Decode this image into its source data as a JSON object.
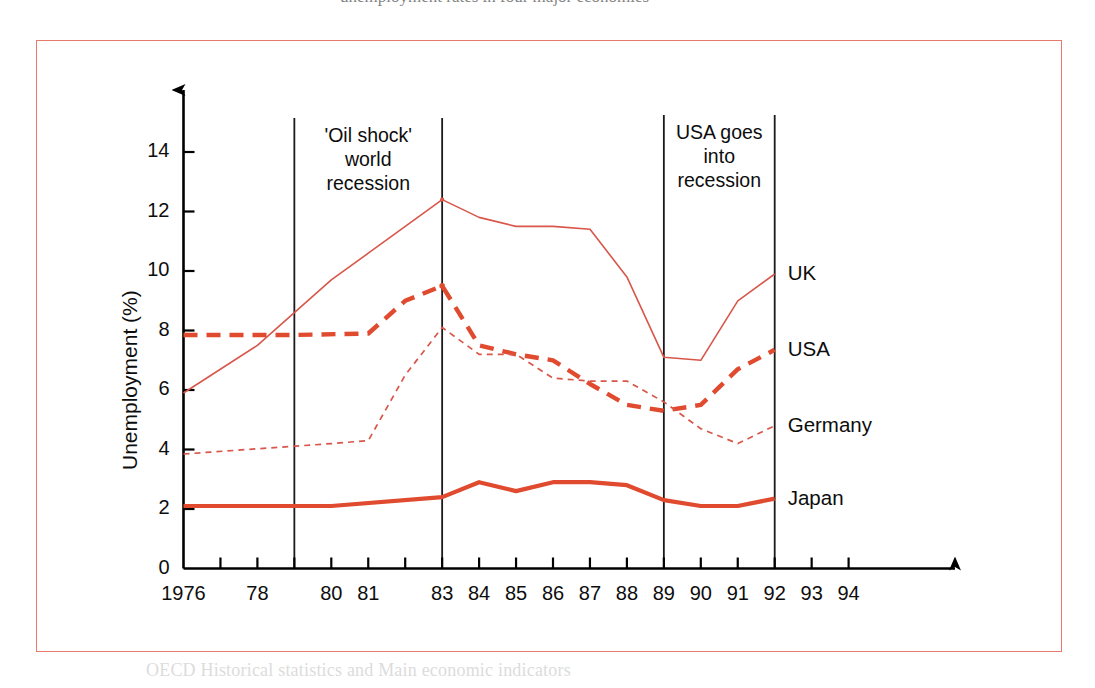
{
  "figure": {
    "frame_color": "#e8796a",
    "background": "#ffffff",
    "top_partial_text": "unemployment rates in four major economies",
    "bottom_partial_text": "OECD Historical statistics and Main economic indicators"
  },
  "chart_data": {
    "type": "line",
    "title": "",
    "subtitle": "",
    "xlabel": "",
    "ylabel": "Unemployment (%)",
    "xlim": [
      1976,
      1994.6
    ],
    "ylim": [
      0,
      15.2
    ],
    "yticks": [
      0,
      2,
      4,
      6,
      8,
      10,
      12,
      14
    ],
    "ytick_labels": [
      "0",
      "2",
      "4",
      "6",
      "8",
      "10",
      "12",
      "14"
    ],
    "xticks": [
      1976,
      1977,
      1978,
      1979,
      1980,
      1981,
      1982,
      1983,
      1984,
      1985,
      1986,
      1987,
      1988,
      1989,
      1990,
      1991,
      1992,
      1993,
      1994
    ],
    "xtick_labels": [
      "1976",
      "",
      "78",
      "",
      "80",
      "81",
      "",
      "83",
      "84",
      "85",
      "86",
      "87",
      "88",
      "89",
      "90",
      "91",
      "92",
      "93",
      "94"
    ],
    "grid": false,
    "legend_position": "right-of-line-ends",
    "series": [
      {
        "name": "UK",
        "label": "UK",
        "color": "#d8564a",
        "style": "solid-thin",
        "x": [
          1976,
          1978,
          1980,
          1981,
          1983,
          1984,
          1985,
          1986,
          1987,
          1988,
          1989,
          1990,
          1991,
          1992
        ],
        "values": [
          5.9,
          7.5,
          9.7,
          10.6,
          12.4,
          11.8,
          11.5,
          11.5,
          11.4,
          9.8,
          7.1,
          7.0,
          9.0,
          9.9
        ]
      },
      {
        "name": "USA",
        "label": "USA",
        "color": "#e04a2f",
        "style": "dashed-thick",
        "x": [
          1976,
          1979,
          1981,
          1982,
          1983,
          1984,
          1985,
          1986,
          1987,
          1988,
          1989,
          1990,
          1991,
          1992
        ],
        "values": [
          7.85,
          7.85,
          7.9,
          9.0,
          9.5,
          7.5,
          7.2,
          7.0,
          6.2,
          5.5,
          5.3,
          5.5,
          6.7,
          7.35
        ]
      },
      {
        "name": "Germany",
        "label": "Germany",
        "color": "#d8564a",
        "style": "dotted-thin",
        "x": [
          1976,
          1980,
          1981,
          1982,
          1983,
          1984,
          1985,
          1986,
          1987,
          1988,
          1989,
          1990,
          1991,
          1992
        ],
        "values": [
          3.85,
          4.2,
          4.3,
          6.5,
          8.1,
          7.2,
          7.2,
          6.4,
          6.3,
          6.3,
          5.6,
          4.7,
          4.2,
          4.8
        ]
      },
      {
        "name": "Japan",
        "label": "Japan",
        "color": "#e04a2f",
        "style": "solid-thick",
        "x": [
          1976,
          1980,
          1983,
          1984,
          1985,
          1986,
          1987,
          1988,
          1989,
          1990,
          1991,
          1992
        ],
        "values": [
          2.1,
          2.1,
          2.4,
          2.9,
          2.6,
          2.9,
          2.9,
          2.8,
          2.3,
          2.1,
          2.1,
          2.35
        ]
      }
    ],
    "annotations": [
      {
        "id": "oil-shock",
        "text": "'Oil shock'\nworld\nrecession",
        "line1": "'Oil shock'",
        "line2": "world",
        "line3": "recession",
        "span_start_year": 1979,
        "span_end_year": 1983
      },
      {
        "id": "usa-recession",
        "text": "USA goes\ninto\nrecession",
        "line1": "USA goes",
        "line2": "into",
        "line3": "recession",
        "span_start_year": 1989,
        "span_end_year": 1992
      }
    ]
  }
}
